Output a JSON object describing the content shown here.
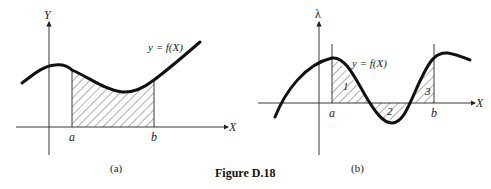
{
  "figure_title": "Figure D.18",
  "panel_a": {
    "caption": "(a)",
    "y_axis_label": "Y",
    "x_axis_label": "X",
    "curve_label": "y = f(X)",
    "lower_limit_label": "a",
    "upper_limit_label": "b"
  },
  "panel_b": {
    "caption": "(b)",
    "y_axis_label": "λ",
    "x_axis_label": "X",
    "curve_label": "y = f(X)",
    "lower_limit_label": "a",
    "upper_limit_label": "b",
    "region_labels": [
      "1",
      "2",
      "3"
    ]
  },
  "colors": {
    "ink": "#111111",
    "background": "#ffffff"
  }
}
